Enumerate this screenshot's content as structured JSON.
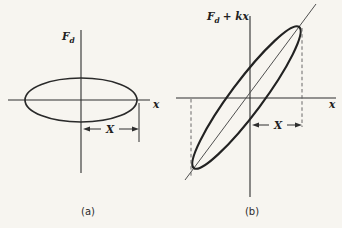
{
  "figure": {
    "description_colors": {
      "ink": "#2a2a2a",
      "paper": "#f7f5f0",
      "thin_line": "#4f4f4f"
    },
    "panel_a": {
      "y_axis_label": {
        "main": "F",
        "sub": "d"
      },
      "x_axis_label": "x",
      "amplitude_label": "X",
      "caption": "(a)"
    },
    "panel_b": {
      "y_axis_label": {
        "main": "F",
        "sub": "d",
        "rest": "+ kx"
      },
      "x_axis_label": "x",
      "amplitude_label": "X",
      "caption": "(b)"
    }
  }
}
